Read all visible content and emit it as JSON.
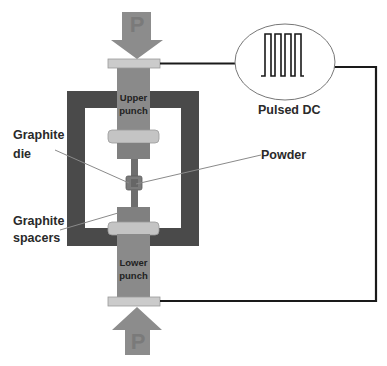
{
  "diagram": {
    "labels": {
      "pressure_top": "P",
      "pressure_bottom": "P",
      "upper_punch": "Upper punch",
      "upper_punch_line1": "Upper",
      "upper_punch_line2": "punch",
      "lower_punch_line1": "Lower",
      "lower_punch_line2": "punch",
      "graphite_die_line1": "Graphite",
      "graphite_die_line2": "die",
      "graphite_spacers_line1": "Graphite",
      "graphite_spacers_line2": "spacers",
      "powder": "Powder",
      "power_supply": "Pulsed DC"
    },
    "colors": {
      "frame": "#4a4a4a",
      "punch": "#8a8a8a",
      "plate": "#c9c9c9",
      "arrow": "#8c8c8c",
      "wire": "#1a1a1a",
      "leader": "#8a8a8a"
    }
  }
}
